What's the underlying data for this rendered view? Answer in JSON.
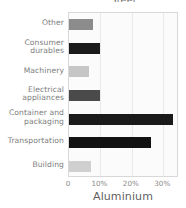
{
  "chart_data": {
    "type": "bar",
    "orientation": "horizontal",
    "title": "Steel",
    "xlabel": "Aluminium",
    "ylabel": "",
    "grid": true,
    "legend": "none",
    "xlim": [
      0,
      35
    ],
    "xticks": [
      {
        "label": "0",
        "value": 0
      },
      {
        "label": "10%",
        "value": 10
      },
      {
        "label": "20%",
        "value": 20
      },
      {
        "label": "30%",
        "value": 30
      }
    ],
    "categories": [
      "Other",
      "Consumer durables",
      "Machinery",
      "Electrical appliances",
      "Container and packaging",
      "Transportation",
      "Building"
    ],
    "values": [
      7.5,
      10.0,
      6.5,
      9.8,
      33.0,
      26.0,
      7.0
    ],
    "bars": [
      {
        "category": "Other",
        "label_lines": [
          "Other"
        ],
        "value": 7.5,
        "color": "#8c8c8c"
      },
      {
        "category": "Consumer durables",
        "label_lines": [
          "Consumer",
          "durables"
        ],
        "value": 10.0,
        "color": "#1a1a1a"
      },
      {
        "category": "Machinery",
        "label_lines": [
          "Machinery"
        ],
        "value": 6.5,
        "color": "#c6c6c6"
      },
      {
        "category": "Electrical appliances",
        "label_lines": [
          "Electrical",
          "appliances"
        ],
        "value": 9.8,
        "color": "#4a4a4a"
      },
      {
        "category": "Container and packaging",
        "label_lines": [
          "Container and",
          "packaging"
        ],
        "value": 33.0,
        "color": "#1a1a1a"
      },
      {
        "category": "Transportation",
        "label_lines": [
          "Transportation"
        ],
        "value": 26.0,
        "color": "#121212"
      },
      {
        "category": "Building",
        "label_lines": [
          "Building"
        ],
        "value": 7.0,
        "color": "#cfcfcf"
      }
    ],
    "colors": {
      "plot_background": "#fbfbfb",
      "frame": "#d8d8d8",
      "gridline": "#e9e9e9",
      "label_text": "#7c7c7c",
      "tick_text": "#8a8a8a"
    }
  }
}
